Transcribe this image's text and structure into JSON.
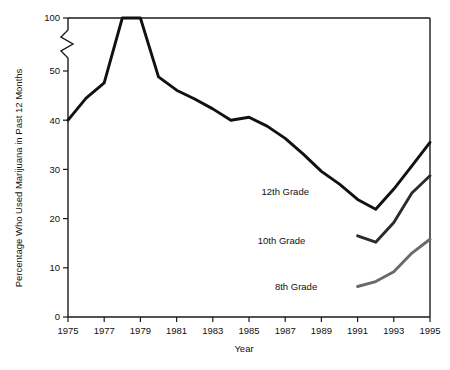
{
  "chart_data": {
    "type": "line",
    "title": "",
    "xlabel": "Year",
    "ylabel": "Percentage Who Used Marijuana in Past 12 Months",
    "xlim": [
      1975,
      1995
    ],
    "ylim": [
      0,
      100
    ],
    "grid": false,
    "legend_position": "inline-annotations",
    "axis_break": {
      "present": true,
      "between": [
        55,
        95
      ],
      "axis": "y",
      "note": "zigzag break mark on y-axis between 50 and 100"
    },
    "x_ticks": [
      1975,
      1977,
      1979,
      1981,
      1983,
      1985,
      1987,
      1989,
      1991,
      1993,
      1995
    ],
    "x_tick_labels": [
      "1975",
      "1977",
      "1979",
      "1981",
      "1983",
      "1985",
      "1987",
      "1989",
      "1991",
      "1993",
      "1995"
    ],
    "y_ticks": [
      0,
      10,
      20,
      30,
      40,
      50,
      100
    ],
    "y_tick_labels": [
      "0",
      "10",
      "20",
      "30",
      "40",
      "50",
      "100"
    ],
    "series": [
      {
        "name": "12th Grade",
        "color": "#111111",
        "label": "12th Grade",
        "x": [
          1975,
          1976,
          1977,
          1978,
          1979,
          1980,
          1981,
          1982,
          1983,
          1984,
          1985,
          1986,
          1987,
          1988,
          1989,
          1990,
          1991,
          1992,
          1993,
          1994,
          1995
        ],
        "values": [
          40.0,
          44.5,
          47.6,
          50.2,
          50.8,
          48.8,
          46.1,
          44.3,
          42.3,
          40.0,
          40.6,
          38.8,
          36.3,
          33.1,
          29.6,
          27.0,
          23.9,
          21.9,
          26.0,
          30.7,
          35.5
        ]
      },
      {
        "name": "10th Grade",
        "color": "#2b2b2b",
        "label": "10th Grade",
        "x": [
          1991,
          1992,
          1993,
          1994,
          1995
        ],
        "values": [
          16.5,
          15.2,
          19.2,
          25.2,
          28.7
        ]
      },
      {
        "name": "8th Grade",
        "color": "#6a6a6a",
        "label": "8th Grade",
        "x": [
          1991,
          1992,
          1993,
          1994,
          1995
        ],
        "values": [
          6.2,
          7.2,
          9.2,
          13.0,
          15.8
        ]
      }
    ],
    "annotations": [
      {
        "text": "12th Grade",
        "x": 1987.0,
        "y": 25.5
      },
      {
        "text": "10th Grade",
        "x": 1986.8,
        "y": 15.5
      },
      {
        "text": "8th Grade",
        "x": 1987.6,
        "y": 6.2
      }
    ]
  }
}
